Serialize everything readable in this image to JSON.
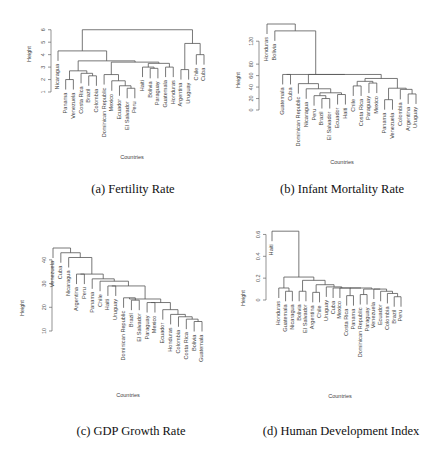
{
  "figure": {
    "panels": [
      {
        "caption": "(a) Fertility Rate",
        "xlabel": "Countries",
        "ylabel": "Height"
      },
      {
        "caption": "(b) Infant Mortality Rate",
        "xlabel": "Countries",
        "ylabel": "Height"
      },
      {
        "caption": "(c) GDP Growth Rate",
        "xlabel": "Countries",
        "ylabel": "Height"
      },
      {
        "caption": "(d) Human Development Index",
        "xlabel": "Countries",
        "ylabel": "Height"
      }
    ]
  },
  "chart_data": [
    {
      "type": "dendrogram",
      "title": "(a) Fertility Rate",
      "xlabel": "Countries",
      "ylabel": "Height",
      "yticks": [
        1,
        2,
        3,
        4,
        5,
        6
      ],
      "ylim": [
        1,
        6.3
      ],
      "leaves": [
        "Nicaragua",
        "Panama",
        "Venezuela",
        "Costa Rica",
        "Brazil",
        "Colombia",
        "Dominican Republic",
        "Mexico",
        "Ecuador",
        "El Salvador",
        "Peru",
        "Haiti",
        "Bolivia",
        "Paraguay",
        "Guatemala",
        "Honduras",
        "Argentina",
        "Uruguay",
        "Chile",
        "Cuba"
      ],
      "merges": [
        {
          "left": "Panama",
          "right": "Venezuela",
          "height": 2.0
        },
        {
          "left": "Brazil",
          "right": "Colombia",
          "height": 2.3
        },
        {
          "left": "Costa Rica",
          "right": "Brazil+Colombia",
          "height": 2.5
        },
        {
          "left": "Panama+Venezuela",
          "right": "Costa Rica+Brazil+Colombia",
          "height": 2.7
        },
        {
          "left": "El Salvador",
          "right": "Peru",
          "height": 1.3
        },
        {
          "left": "Ecuador",
          "right": "El Salvador+Peru",
          "height": 1.5
        },
        {
          "left": "Mexico",
          "right": "Ecuador+El Salvador+Peru",
          "height": 1.9
        },
        {
          "left": "Dominican Republic",
          "right": "Mexico+...",
          "height": 2.4
        },
        {
          "left": "Bolivia",
          "right": "Paraguay",
          "height": 2.9
        },
        {
          "left": "Haiti",
          "right": "Bolivia+Paraguay",
          "height": 3.0
        },
        {
          "left": "Guatemala",
          "right": "Honduras",
          "height": 3.0
        },
        {
          "left": "Haiti group",
          "right": "Guatemala+Honduras",
          "height": 3.3
        },
        {
          "left": "Dominican Republic group",
          "right": "Haiti group",
          "height": 3.4
        },
        {
          "left": "Panama group",
          "right": "Dominican Republic group",
          "height": 3.5
        },
        {
          "left": "Nicaragua",
          "right": "rest of cluster",
          "height": 4.3
        },
        {
          "left": "Argentina",
          "right": "Uruguay",
          "height": 2.8
        },
        {
          "left": "Chile",
          "right": "Cuba",
          "height": 4.0
        },
        {
          "left": "Argentina+Uruguay",
          "right": "Chile+Cuba",
          "height": 4.9
        },
        {
          "left": "Latin cluster",
          "right": "Southern cone cluster",
          "height": 6.0
        }
      ]
    },
    {
      "type": "dendrogram",
      "title": "(b) Infant Mortality Rate",
      "xlabel": "Countries",
      "ylabel": "Height",
      "yticks": [
        0,
        20,
        40,
        60,
        80,
        120
      ],
      "ylim": [
        0,
        150
      ],
      "leaves": [
        "Honduras",
        "Bolivia",
        "Guatemala",
        "Cuba",
        "Dominican Republic",
        "Nicaragua",
        "Peru",
        "Brazil",
        "El Salvador",
        "Ecuador",
        "Haiti",
        "Chile",
        "Costa Rica",
        "Paraguay",
        "Mexico",
        "Panama",
        "Venezuela",
        "Colombia",
        "Argentina",
        "Uruguay"
      ],
      "merges": [
        {
          "left": "Brazil",
          "right": "El Salvador",
          "height": 20
        },
        {
          "left": "Peru",
          "right": "Brazil+El Salvador",
          "height": 25
        },
        {
          "left": "Ecuador",
          "right": "Haiti",
          "height": 27
        },
        {
          "left": "Peru group",
          "right": "Ecuador+Haiti",
          "height": 30
        },
        {
          "left": "Nicaragua",
          "right": "Peru group",
          "height": 37
        },
        {
          "left": "Dominican Republic",
          "right": "Nicaragua group",
          "height": 46
        },
        {
          "left": "Guatemala",
          "right": "Cuba",
          "height": 62
        },
        {
          "left": "Chile",
          "right": "Costa Rica",
          "height": 42
        },
        {
          "left": "Paraguay",
          "right": "Mexico",
          "height": 47
        },
        {
          "left": "Panama",
          "right": "Venezuela",
          "height": 18
        },
        {
          "left": "Argentina",
          "right": "Uruguay",
          "height": 28
        },
        {
          "left": "Colombia",
          "right": "Argentina+Uruguay",
          "height": 36
        },
        {
          "left": "Panama+Venezuela",
          "right": "Colombia group",
          "height": 38
        },
        {
          "left": "Mexico group",
          "right": "Panama group",
          "height": 40
        },
        {
          "left": "Chile group",
          "right": "Paraguay group",
          "height": 50
        },
        {
          "left": "Guatemala group",
          "right": "Chile group",
          "height": 62
        },
        {
          "left": "Bolivia",
          "right": "main cluster",
          "height": 138
        },
        {
          "left": "Honduras",
          "right": "Bolivia group",
          "height": 150
        }
      ]
    },
    {
      "type": "dendrogram",
      "title": "(c) GDP Growth Rate",
      "xlabel": "Countries",
      "ylabel": "Height",
      "yticks": [
        10,
        20,
        30,
        40
      ],
      "ylim": [
        10,
        45
      ],
      "leaves": [
        "Venezuela",
        "Cuba",
        "Nicaragua",
        "Argentina",
        "Peru",
        "Panama",
        "Chile",
        "Haiti",
        "Uruguay",
        "Dominican Republic",
        "Brazil",
        "El Salvador",
        "Paraguay",
        "Mexico",
        "Ecuador",
        "Honduras",
        "Colombia",
        "Costa Rica",
        "Bolivia",
        "Guatemala"
      ],
      "merges": [
        {
          "left": "Bolivia",
          "right": "Guatemala",
          "height": 14
        },
        {
          "left": "Costa Rica",
          "right": "Bolivia+Guatemala",
          "height": 15
        },
        {
          "left": "Colombia",
          "right": "Costa Rica group",
          "height": 16
        },
        {
          "left": "Honduras",
          "right": "Colombia group",
          "height": 17
        },
        {
          "left": "Ecuador",
          "right": "Honduras group",
          "height": 19
        },
        {
          "left": "Paraguay",
          "right": "Mexico",
          "height": 22
        },
        {
          "left": "Paraguay+Mexico",
          "right": "Ecuador group",
          "height": 22
        },
        {
          "left": "Brazil",
          "right": "El Salvador",
          "height": 23
        },
        {
          "left": "Dominican Republic",
          "right": "Brazil+El Salvador",
          "height": 24
        },
        {
          "left": "Dominican Republic group",
          "right": "Paraguay group",
          "height": 23.5
        },
        {
          "left": "Haiti",
          "right": "Uruguay",
          "height": 29
        },
        {
          "left": "Haiti+Uruguay",
          "right": "Dominican Republic group",
          "height": 29
        },
        {
          "left": "Chile",
          "right": "Haiti group",
          "height": 31
        },
        {
          "left": "Panama",
          "right": "Chile group",
          "height": 32
        },
        {
          "left": "Argentina",
          "right": "Peru",
          "height": 34
        },
        {
          "left": "Argentina+Peru",
          "right": "Panama group",
          "height": 34
        },
        {
          "left": "Nicaragua",
          "right": "Argentina group",
          "height": 41
        },
        {
          "left": "Cuba",
          "right": "Nicaragua group",
          "height": 43
        },
        {
          "left": "Venezuela",
          "right": "Cuba group",
          "height": 45
        }
      ]
    },
    {
      "type": "dendrogram",
      "title": "(d) Human Development Index",
      "xlabel": "Countries",
      "ylabel": "Height",
      "yticks": [
        0.0,
        0.2,
        0.4,
        0.6
      ],
      "ylim": [
        0.0,
        0.65
      ],
      "leaves": [
        "Haiti",
        "Honduras",
        "Guatemala",
        "Nicaragua",
        "Bolivia",
        "El Salvador",
        "Argentina",
        "Chile",
        "Uruguay",
        "Cuba",
        "Mexico",
        "Costa Rica",
        "Panama",
        "Dominican Republic",
        "Paraguay",
        "Venezuela",
        "Ecuador",
        "Colombia",
        "Brazil",
        "Peru"
      ],
      "merges": [
        {
          "left": "Guatemala",
          "right": "Nicaragua",
          "height": 0.08
        },
        {
          "left": "Honduras",
          "right": "Guatemala+Nicaragua",
          "height": 0.11
        },
        {
          "left": "Bolivia",
          "right": "El Salvador",
          "height": 0.08
        },
        {
          "left": "Argentina",
          "right": "Chile",
          "height": 0.07
        },
        {
          "left": "Costa Rica",
          "right": "Panama",
          "height": 0.04
        },
        {
          "left": "Dominican Republic",
          "right": "Paraguay",
          "height": 0.05
        },
        {
          "left": "Brazil",
          "right": "Peru",
          "height": 0.03
        },
        {
          "left": "Colombia",
          "right": "Brazil+Peru",
          "height": 0.06
        },
        {
          "left": "Ecuador",
          "right": "Colombia group",
          "height": 0.08
        },
        {
          "left": "Venezuela",
          "right": "Ecuador group",
          "height": 0.1
        },
        {
          "left": "Dominican Republic group",
          "right": "Venezuela group",
          "height": 0.1
        },
        {
          "left": "Costa Rica group",
          "right": "Dominican Republic group",
          "height": 0.11
        },
        {
          "left": "Mexico",
          "right": "Costa Rica group",
          "height": 0.11
        },
        {
          "left": "Cuba",
          "right": "Mexico group",
          "height": 0.11
        },
        {
          "left": "Uruguay",
          "right": "Cuba group",
          "height": 0.12
        },
        {
          "left": "Argentina+Chile",
          "right": "Uruguay group",
          "height": 0.14
        },
        {
          "left": "Bolivia+El Salvador",
          "right": "Argentina group",
          "height": 0.18
        },
        {
          "left": "Honduras group",
          "right": "Bolivia group",
          "height": 0.21
        },
        {
          "left": "Haiti",
          "right": "rest",
          "height": 0.63
        }
      ]
    }
  ]
}
